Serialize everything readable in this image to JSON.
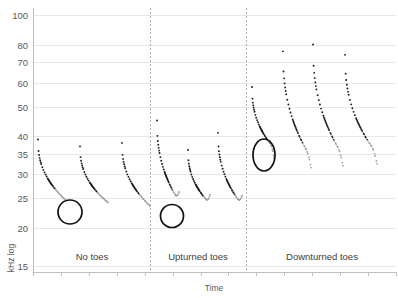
{
  "chart_data": {
    "type": "scatter",
    "title": "",
    "xlabel": "Time",
    "ylabel": "kHz log",
    "yscale": "log",
    "ylim": [
      15,
      105
    ],
    "ytick_labels": [
      "100",
      "80",
      "70",
      "60",
      "50",
      "40",
      "35",
      "30",
      "25",
      "20",
      "15"
    ],
    "ytick_values": [
      100,
      80,
      70,
      60,
      50,
      40,
      35,
      30,
      25,
      20,
      15
    ],
    "xtick_labels": [],
    "grid": true,
    "legend": null,
    "panels": [
      {
        "label": "No toes",
        "calls": [
          {
            "name": "call-1",
            "start_khz": 39,
            "end_khz": 24.6,
            "tail": "flat"
          },
          {
            "name": "call-2",
            "start_khz": 37,
            "end_khz": 24.2,
            "tail": "flat"
          },
          {
            "name": "call-3",
            "start_khz": 38,
            "end_khz": 23.6,
            "tail": "flat"
          }
        ]
      },
      {
        "label": "Upturned toes",
        "calls": [
          {
            "name": "call-4",
            "start_khz": 45,
            "end_khz": 24.5,
            "tail": "upturned"
          },
          {
            "name": "call-5",
            "start_khz": 36,
            "end_khz": 24.0,
            "tail": "upturned"
          },
          {
            "name": "call-6",
            "start_khz": 41,
            "end_khz": 23.8,
            "tail": "upturned"
          }
        ]
      },
      {
        "label": "Downturned toes",
        "calls": [
          {
            "name": "call-7",
            "start_khz": 58,
            "end_khz": 36.5,
            "tail": "downturned"
          },
          {
            "name": "call-8",
            "start_khz": 76,
            "end_khz": 34.0,
            "tail": "downturned"
          },
          {
            "name": "call-9",
            "start_khz": 80,
            "end_khz": 34.5,
            "tail": "downturned"
          },
          {
            "name": "call-10",
            "start_khz": 74,
            "end_khz": 35.0,
            "tail": "downturned"
          }
        ]
      }
    ],
    "annotations": [
      {
        "name": "annotation-ellipse-no-toes",
        "cx": 70,
        "cy": 212,
        "rx": 12,
        "ry": 12
      },
      {
        "name": "annotation-ellipse-upturned-toes",
        "cx": 172,
        "cy": 216,
        "rx": 11.5,
        "ry": 11.5
      },
      {
        "name": "annotation-ellipse-downturned-toes",
        "cx": 264,
        "cy": 155,
        "rx": 11,
        "ry": 16
      }
    ]
  },
  "axes": {
    "y_title": "kHz log",
    "x_title": "Time"
  },
  "colors": {
    "dot_dark": "#1a1a1a",
    "dot_faint": "#9a9a9a",
    "gridline": "#e8e8e8",
    "axis": "#bfbfbf",
    "separator": "#b0b0b0",
    "text": "#595959",
    "annotation": "#111111"
  }
}
